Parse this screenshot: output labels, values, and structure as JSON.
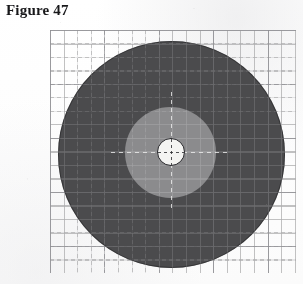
{
  "figure": {
    "label": "Figure 47",
    "caption_position": "top-left"
  },
  "canvas": {
    "width": 303,
    "height": 284,
    "background_color": "#fefefe",
    "medium": "scanned-print"
  },
  "grid": {
    "name": "graph-paper-grid",
    "style": "dashed",
    "minor_spacing_px": 13.5,
    "major_spacing_px": 54,
    "line_color": "#94949 6",
    "minor_color": "#949496",
    "major_color": "#78787c",
    "left": 50,
    "top": 30,
    "width": 246,
    "height": 243
  },
  "chart_data": {
    "type": "pie",
    "title": "Figure 47",
    "subtitle": "",
    "xlabel": "",
    "ylabel": "",
    "legend_position": "none",
    "grid": true,
    "rings": [
      {
        "name": "outer-disc",
        "label": "Outer disc",
        "color": "#4b4b4d",
        "tone": "dark-grey",
        "center_x": 171,
        "center_y": 154,
        "diameter_px": 227,
        "radius_px": 113.5
      },
      {
        "name": "inner-disc",
        "label": "Inner disc",
        "color": "#8b8b8d",
        "tone": "light-grey",
        "center_x": 170,
        "center_y": 152,
        "diameter_px": 91,
        "radius_px": 45.5
      },
      {
        "name": "center-hole",
        "label": "Centre hole",
        "color": "#f4f4f2",
        "tone": "white",
        "center_x": 171,
        "center_y": 152,
        "diameter_px": 28,
        "radius_px": 14,
        "outline_color": "#26262a"
      }
    ],
    "categories": [
      "Outer disc",
      "Inner disc",
      "Centre hole"
    ],
    "values": [
      113.5,
      45.5,
      14
    ],
    "values_unit": "radius in pixels",
    "center_marker": {
      "name": "crosshair",
      "style": "dashed",
      "x": 171,
      "y": 152
    }
  },
  "colors": {
    "outer_ring": "#4b4b4d",
    "inner_ring": "#8b8b8d",
    "hole": "#f4f4f2",
    "hole_outline": "#26262a",
    "grid_minor": "#949496",
    "grid_major": "#78787c",
    "title_text": "#18181a",
    "page_background": "#fefefe"
  }
}
